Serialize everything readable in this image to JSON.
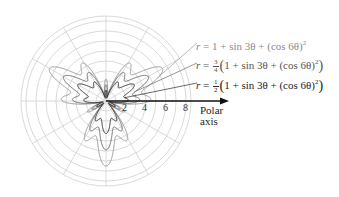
{
  "chart_data": {
    "type": "line",
    "subtype": "polar",
    "title": "",
    "axis_label": "Polar axis",
    "axis_label_lines": [
      "Polar",
      "axis"
    ],
    "tick_labels": [
      "2",
      "4",
      "6",
      "8"
    ],
    "tick_values": [
      2,
      4,
      6,
      8
    ],
    "grid": {
      "rings": 8,
      "ring_step": 1,
      "outer_ring_radius_units": 8.5,
      "radial_line_step_deg": 30,
      "color": "#cfcfcf"
    },
    "center_px": [
      106,
      101
    ],
    "px_per_tick_unit": 10,
    "px_per_formula_unit": 21.7,
    "series": [
      {
        "name": "r = 1 + sin 3θ + (cos 6θ)^2",
        "scale": 1.0,
        "color": "#9a9a9a",
        "max_r": 3
      },
      {
        "name": "r = 3/4(1 + sin 3θ + (cos 6θ)^2)",
        "scale": 0.75,
        "color": "#6a6a6a",
        "max_r": 2.25
      },
      {
        "name": "r = 1/2(1 + sin 3θ + (cos 6θ)^2)",
        "scale": 0.5,
        "color": "#2a2a2a",
        "max_r": 1.5
      }
    ],
    "legend_position": "right, with leader lines"
  },
  "labels": {
    "r1": {
      "lhs": "r",
      "eq": "=",
      "body": "1 + sin 3θ + (cos 6θ)",
      "sup": "2"
    },
    "r2": {
      "lhs": "r",
      "eq": "=",
      "num": "3",
      "den": "4",
      "open": "(",
      "body": "1 + sin 3θ + (cos 6θ)",
      "sup": "2",
      "close": ")"
    },
    "r3": {
      "lhs": "r",
      "eq": "=",
      "num": "1",
      "den": "2",
      "open": "(",
      "body": "1 + sin 3θ + (cos 6θ)",
      "sup": "2",
      "close": ")"
    }
  },
  "axis": {
    "line1": "Polar",
    "line2": "axis"
  },
  "ticks": [
    "2",
    "4",
    "6",
    "8"
  ]
}
